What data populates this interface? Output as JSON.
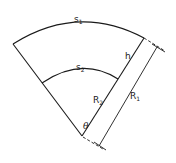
{
  "diagram": {
    "type": "annular-sector",
    "labels": {
      "outer_arc": {
        "main": "s",
        "sub": "1"
      },
      "inner_arc": {
        "main": "s",
        "sub": "2"
      },
      "thickness": "h",
      "inner_radius": {
        "main": "R",
        "sub": "2"
      },
      "outer_radius": {
        "main": "R",
        "sub": "1"
      },
      "angle": "θ"
    }
  }
}
